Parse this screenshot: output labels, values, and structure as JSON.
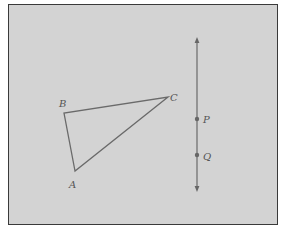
{
  "diagram": {
    "background": "#d3d3d3",
    "stroke_color": "#666666",
    "triangle": {
      "vertices": [
        {
          "label": "A",
          "x": 75,
          "y": 171
        },
        {
          "label": "B",
          "x": 64,
          "y": 113
        },
        {
          "label": "C",
          "x": 168,
          "y": 97
        }
      ]
    },
    "line": {
      "x": 197,
      "y_top": 37,
      "y_bottom": 192,
      "arrows": "both",
      "points": [
        {
          "label": "P",
          "y": 119
        },
        {
          "label": "Q",
          "y": 155
        }
      ]
    },
    "labels": {
      "a": "A",
      "b": "B",
      "c": "C",
      "p": "P",
      "q": "Q"
    }
  }
}
